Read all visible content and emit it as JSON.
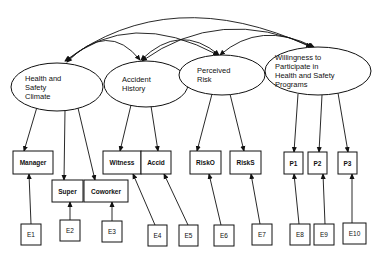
{
  "latent": [
    {
      "id": "hsc",
      "lines": [
        "Health and",
        "Safety",
        "Climate"
      ],
      "cx": 57,
      "cy": 87,
      "rx": 46,
      "ry": 24
    },
    {
      "id": "ah",
      "lines": [
        "Accident",
        "History"
      ],
      "cx": 146,
      "cy": 84,
      "rx": 42,
      "ry": 23
    },
    {
      "id": "pr",
      "lines": [
        "Perceived",
        "Risk"
      ],
      "cx": 222,
      "cy": 75,
      "rx": 43,
      "ry": 20
    },
    {
      "id": "wp",
      "lines": [
        "Willingness to",
        "Participate in",
        "Health and Safety",
        "Programs"
      ],
      "cx": 318,
      "cy": 71,
      "rx": 53,
      "ry": 24
    }
  ],
  "observed": [
    {
      "id": "manager",
      "label": "Manager",
      "x": 13,
      "y": 151,
      "w": 40,
      "h": 23
    },
    {
      "id": "super",
      "label": "Super",
      "x": 52,
      "y": 180,
      "w": 31,
      "h": 22
    },
    {
      "id": "coworker",
      "label": "Coworker",
      "x": 84,
      "y": 180,
      "w": 44,
      "h": 22
    },
    {
      "id": "witness",
      "label": "Witness",
      "x": 103,
      "y": 151,
      "w": 38,
      "h": 23
    },
    {
      "id": "accid",
      "label": "Accid",
      "x": 141,
      "y": 151,
      "w": 30,
      "h": 23
    },
    {
      "id": "risko",
      "label": "RiskO",
      "x": 190,
      "y": 151,
      "w": 31,
      "h": 23
    },
    {
      "id": "risks",
      "label": "RiskS",
      "x": 230,
      "y": 151,
      "w": 31,
      "h": 23
    },
    {
      "id": "p1",
      "label": "P1",
      "x": 284,
      "y": 152,
      "w": 19,
      "h": 22
    },
    {
      "id": "p2",
      "label": "P2",
      "x": 308,
      "y": 152,
      "w": 19,
      "h": 22
    },
    {
      "id": "p3",
      "label": "P3",
      "x": 338,
      "y": 152,
      "w": 19,
      "h": 22
    }
  ],
  "errors": [
    {
      "id": "e1",
      "label": "E1",
      "x": 21,
      "y": 224,
      "w": 20,
      "h": 21
    },
    {
      "id": "e2",
      "label": "E2",
      "x": 60,
      "y": 220,
      "w": 20,
      "h": 21
    },
    {
      "id": "e3",
      "label": "E3",
      "x": 102,
      "y": 221,
      "w": 20,
      "h": 21
    },
    {
      "id": "e4",
      "label": "E4",
      "x": 148,
      "y": 225,
      "w": 19,
      "h": 21
    },
    {
      "id": "e5",
      "label": "E5",
      "x": 179,
      "y": 225,
      "w": 19,
      "h": 21
    },
    {
      "id": "e6",
      "label": "E6",
      "x": 214,
      "y": 225,
      "w": 20,
      "h": 21
    },
    {
      "id": "e7",
      "label": "E7",
      "x": 252,
      "y": 224,
      "w": 20,
      "h": 21
    },
    {
      "id": "e8",
      "label": "E8",
      "x": 290,
      "y": 224,
      "w": 20,
      "h": 21
    },
    {
      "id": "e9",
      "label": "E9",
      "x": 314,
      "y": 224,
      "w": 20,
      "h": 21
    },
    {
      "id": "e10",
      "label": "E10",
      "x": 343,
      "y": 223,
      "w": 23,
      "h": 21
    }
  ],
  "loadings": [
    {
      "from": "hsc",
      "to": "manager",
      "x1": 37,
      "y1": 107,
      "x2": 24,
      "y2": 151
    },
    {
      "from": "hsc",
      "to": "super",
      "x1": 65,
      "y1": 110,
      "x2": 64,
      "y2": 180
    },
    {
      "from": "hsc",
      "to": "coworker",
      "x1": 78,
      "y1": 108,
      "x2": 95,
      "y2": 180
    },
    {
      "from": "ah",
      "to": "witness",
      "x1": 131,
      "y1": 105,
      "x2": 120,
      "y2": 151
    },
    {
      "from": "ah",
      "to": "accid",
      "x1": 151,
      "y1": 106,
      "x2": 158,
      "y2": 151
    },
    {
      "from": "pr",
      "to": "risko",
      "x1": 212,
      "y1": 94,
      "x2": 197,
      "y2": 151
    },
    {
      "from": "pr",
      "to": "risks",
      "x1": 230,
      "y1": 94,
      "x2": 244,
      "y2": 151
    },
    {
      "from": "wp",
      "to": "p1",
      "x1": 298,
      "y1": 94,
      "x2": 294,
      "y2": 152
    },
    {
      "from": "wp",
      "to": "p2",
      "x1": 322,
      "y1": 95,
      "x2": 319,
      "y2": 152
    },
    {
      "from": "wp",
      "to": "p3",
      "x1": 338,
      "y1": 93,
      "x2": 348,
      "y2": 152
    }
  ],
  "error_paths": [
    {
      "from": "e1",
      "to": "manager",
      "x1": 31,
      "y1": 224,
      "x2": 29,
      "y2": 174
    },
    {
      "from": "e2",
      "to": "super",
      "x1": 70,
      "y1": 220,
      "x2": 70,
      "y2": 202
    },
    {
      "from": "e3",
      "to": "coworker",
      "x1": 112,
      "y1": 221,
      "x2": 112,
      "y2": 202
    },
    {
      "from": "e4",
      "to": "witness",
      "x1": 155,
      "y1": 225,
      "x2": 133,
      "y2": 174
    },
    {
      "from": "e5",
      "to": "accid",
      "x1": 188,
      "y1": 225,
      "x2": 164,
      "y2": 174
    },
    {
      "from": "e6",
      "to": "risko",
      "x1": 221,
      "y1": 225,
      "x2": 209,
      "y2": 174
    },
    {
      "from": "e7",
      "to": "risks",
      "x1": 260,
      "y1": 224,
      "x2": 251,
      "y2": 174
    },
    {
      "from": "e8",
      "to": "p1",
      "x1": 299,
      "y1": 224,
      "x2": 294,
      "y2": 174
    },
    {
      "from": "e9",
      "to": "p2",
      "x1": 325,
      "y1": 224,
      "x2": 323,
      "y2": 174
    },
    {
      "from": "e10",
      "to": "p3",
      "x1": 352,
      "y1": 223,
      "x2": 352,
      "y2": 174
    }
  ],
  "covariances": [
    {
      "from": "hsc",
      "to": "ah",
      "d": "M 67 62 Q 108 20 140 60"
    },
    {
      "from": "hsc",
      "to": "pr",
      "d": "M 66 61 Q 130 8 218 55"
    },
    {
      "from": "hsc",
      "to": "wp",
      "d": "M 65 61 Q 170 -18 311 47"
    },
    {
      "from": "ah",
      "to": "pr",
      "d": "M 141 60 Q 180 22 219 55"
    },
    {
      "from": "ah",
      "to": "wp",
      "d": "M 142 61 Q 220 5 313 47"
    },
    {
      "from": "pr",
      "to": "wp",
      "d": "M 220 55 Q 260 20 314 47"
    }
  ]
}
